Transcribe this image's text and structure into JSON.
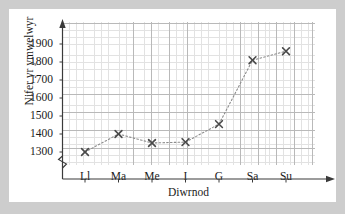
{
  "chart_data": {
    "type": "line",
    "title": "",
    "xlabel": "Diwrnod",
    "ylabel": "Nifer yr ymwelwyr",
    "categories": [
      "Ll",
      "Ma",
      "Me",
      "I",
      "G",
      "Sa",
      "Su"
    ],
    "values": [
      1300,
      1400,
      1350,
      1355,
      1455,
      1810,
      1860
    ],
    "series": [
      {
        "name": "Nifer yr ymwelwyr",
        "values": [
          1300,
          1400,
          1350,
          1355,
          1455,
          1810,
          1860
        ]
      }
    ],
    "ytick_labels": [
      "1900",
      "1800",
      "1700",
      "1600",
      "1500",
      "1400",
      "1300"
    ],
    "ytick_values": [
      1900,
      1800,
      1700,
      1600,
      1500,
      1400,
      1300
    ],
    "ylim": [
      1300,
      1900
    ],
    "y_axis_break": true,
    "grid": true,
    "legend": false,
    "marker": "x-cross",
    "line_style": "dotted",
    "line_color": "#8c8c8c",
    "marker_color": "#4a4a4a",
    "grid_color": "#d8d8d8",
    "axis_color": "#3a3a3a",
    "background_color": "#ffffff",
    "page_color": "#cdcdcd"
  }
}
